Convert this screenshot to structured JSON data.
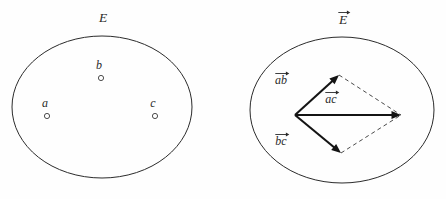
{
  "figure": {
    "background_color": "#fefefe",
    "stroke_color": "#2b2b2b",
    "vector_color": "#141414",
    "dash_color": "#4a4a4a",
    "panels": [
      {
        "id": "left",
        "name": "set-diagram",
        "set_label": "E",
        "set_label_has_arrow": false,
        "points": [
          {
            "id": "a",
            "label": "a",
            "cx": 47,
            "cy": 116,
            "label_x": 45,
            "label_y": 107
          },
          {
            "id": "b",
            "label": "b",
            "cx": 101,
            "cy": 78,
            "label_x": 99,
            "label_y": 69
          },
          {
            "id": "c",
            "label": "c",
            "cx": 155,
            "cy": 116,
            "label_x": 153,
            "label_y": 107
          }
        ]
      },
      {
        "id": "right",
        "name": "vector-diagram",
        "set_label": "E",
        "set_label_has_arrow": true,
        "vectors": [
          {
            "id": "ab",
            "label": "ab",
            "from_x": 295,
            "from_y": 115,
            "to_x": 339,
            "to_y": 75,
            "label_x": 281,
            "label_y": 84
          },
          {
            "id": "ac",
            "label": "ac",
            "from_x": 295,
            "from_y": 115,
            "to_x": 401,
            "to_y": 115,
            "label_x": 331,
            "label_y": 103
          },
          {
            "id": "bc",
            "label": "bc",
            "from_x": 295,
            "from_y": 115,
            "to_x": 341,
            "to_y": 153,
            "label_x": 281,
            "label_y": 145
          }
        ],
        "dashed_edges": [
          {
            "id": "ab-to-ac",
            "from_x": 339,
            "from_y": 75,
            "to_x": 401,
            "to_y": 115
          },
          {
            "id": "bc-to-ac",
            "from_x": 341,
            "from_y": 153,
            "to_x": 401,
            "to_y": 115
          }
        ]
      }
    ]
  },
  "geometry": {
    "left_ellipse": {
      "cx": 102,
      "cy": 107,
      "rx": 90,
      "ry": 71
    },
    "right_ellipse": {
      "cx": 342,
      "cy": 110,
      "rx": 92,
      "ry": 73
    },
    "left_set_label": {
      "x": 103,
      "y": 22
    },
    "right_set_label": {
      "x": 343,
      "y": 24
    }
  }
}
